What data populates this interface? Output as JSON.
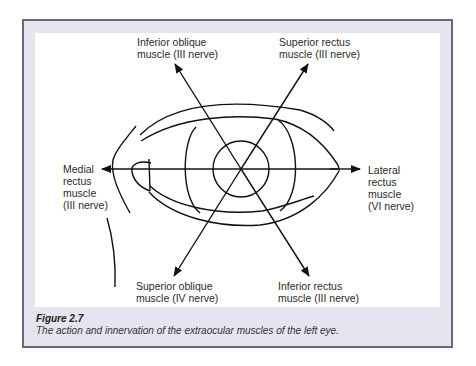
{
  "figure": {
    "number_label": "Figure 2.7",
    "caption": "The action and innervation of the extraocular muscles of the left eye.",
    "colors": {
      "frame_background": "#e6e4ee",
      "frame_border": "#6a6580",
      "panel_background": "#ffffff",
      "line_color": "#111111"
    }
  },
  "diagram": {
    "subject": "left eye",
    "labels": {
      "inferior_oblique": [
        "Inferior oblique",
        "muscle (III nerve)"
      ],
      "superior_rectus": [
        "Superior rectus",
        "muscle (III nerve)"
      ],
      "medial_rectus": [
        "Medial",
        "rectus",
        "muscle",
        "(III nerve)"
      ],
      "lateral_rectus": [
        "Lateral",
        "rectus",
        "muscle",
        "(VI nerve)"
      ],
      "superior_oblique": [
        "Superior oblique",
        "muscle (IV nerve)"
      ],
      "inferior_rectus": [
        "Inferior rectus",
        "muscle (III nerve)"
      ]
    },
    "arrows": [
      {
        "muscle": "Inferior oblique",
        "direction": "up-left"
      },
      {
        "muscle": "Superior rectus",
        "direction": "up-right"
      },
      {
        "muscle": "Medial rectus",
        "direction": "left"
      },
      {
        "muscle": "Lateral rectus",
        "direction": "right"
      },
      {
        "muscle": "Superior oblique",
        "direction": "down-left"
      },
      {
        "muscle": "Inferior rectus",
        "direction": "down-right"
      }
    ]
  }
}
